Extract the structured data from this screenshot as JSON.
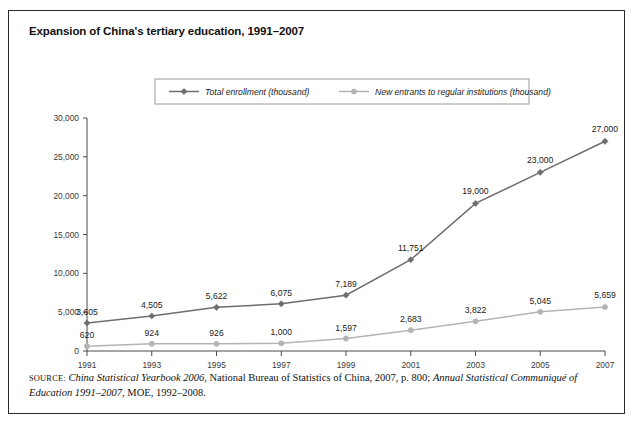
{
  "figure": {
    "title": "Expansion of China's tertiary education, 1991–2007",
    "source": {
      "label": "source:",
      "line1_italic_a": "China Statistical Yearbook 2006",
      "line1_plain_a": ", National Bureau of Statistics of China, 2007, p. 800; ",
      "line1_italic_b": "Annual Statistical Communiqué of Education",
      "line2_italic": "1991–2007",
      "line2_plain": ", MOE, 1992–2008."
    }
  },
  "chart_data": {
    "type": "line",
    "title": "Expansion of China's tertiary education, 1991–2007",
    "xlabel": "",
    "ylabel": "",
    "categories": [
      "1991",
      "1993",
      "1995",
      "1997",
      "1999",
      "2001",
      "2003",
      "2005",
      "2007"
    ],
    "x": [
      1991,
      1993,
      1995,
      1997,
      1999,
      2001,
      2003,
      2005,
      2007
    ],
    "xlim": [
      1990,
      2008
    ],
    "ylim": [
      0,
      30000
    ],
    "yticks": [
      0,
      5000,
      10000,
      15000,
      20000,
      25000,
      30000
    ],
    "ytick_labels": [
      "0",
      "5,000",
      "10,000",
      "15,000",
      "20,000",
      "25,000",
      "30,000"
    ],
    "grid": false,
    "legend_position": "top-center",
    "series": [
      {
        "name": "Total enrollment (thousand)",
        "color": "#6e6e6e",
        "marker": "diamond",
        "values": [
          3605,
          4505,
          5622,
          6075,
          7189,
          11751,
          19000,
          23000,
          27000
        ],
        "labels": [
          "3,605",
          "4,505",
          "5,622",
          "6,075",
          "7,189",
          "11,751",
          "19,000",
          "23,000",
          "27,000"
        ]
      },
      {
        "name": "New entrants to regular institutions (thousand)",
        "color": "#b4b4b4",
        "marker": "circle",
        "values": [
          620,
          924,
          926,
          1000,
          1597,
          2683,
          3822,
          5045,
          5659
        ],
        "labels": [
          "620",
          "924",
          "926",
          "1,000",
          "1,597",
          "2,683",
          "3,822",
          "5,045",
          "5,659"
        ]
      }
    ]
  }
}
